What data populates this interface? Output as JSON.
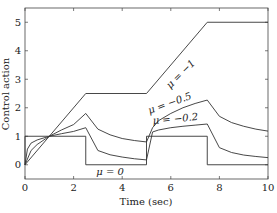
{
  "chart_data": {
    "type": "line",
    "title": "",
    "xlabel": "Time (sec)",
    "ylabel": "Control action",
    "xlim": [
      0,
      10
    ],
    "ylim": [
      -0.5,
      5.5
    ],
    "xticks": [
      0,
      2,
      4,
      6,
      8,
      10
    ],
    "yticks": [
      0,
      1,
      2,
      3,
      4,
      5
    ],
    "grid": false,
    "legend": "none (inline annotations)",
    "series": [
      {
        "name": "μ = −1",
        "label": "μ = −1",
        "x": [
          0,
          2.5,
          5,
          7.5,
          10
        ],
        "y": [
          0,
          2.5,
          2.5,
          5,
          5
        ]
      },
      {
        "name": "μ = −0.5",
        "label": "μ = −0.5",
        "x": [
          0,
          0.25,
          0.5,
          1,
          1.5,
          2,
          2.5,
          2.5,
          3,
          3.5,
          4,
          4.5,
          5,
          5,
          5.25,
          5.5,
          6,
          6.5,
          7,
          7.5,
          7.5,
          8,
          8.5,
          9,
          9.5,
          10
        ],
        "y": [
          0,
          0.5,
          0.71,
          1.0,
          1.22,
          1.41,
          1.8,
          1.8,
          1.25,
          1.05,
          0.92,
          0.85,
          0.8,
          0.8,
          1.3,
          1.55,
          1.8,
          2.0,
          2.15,
          2.27,
          2.27,
          1.7,
          1.48,
          1.35,
          1.25,
          1.18
        ]
      },
      {
        "name": "μ = −0.2",
        "label": "μ = −0.2",
        "x": [
          0,
          0.1,
          0.25,
          0.5,
          1,
          1.5,
          2,
          2.5,
          2.5,
          3,
          3.5,
          4,
          4.5,
          5,
          5,
          5.25,
          5.5,
          6,
          6.5,
          7,
          7.5,
          7.5,
          8,
          8.5,
          9,
          9.5,
          10
        ],
        "y": [
          0,
          0.55,
          0.76,
          0.87,
          1.0,
          1.09,
          1.17,
          1.3,
          1.3,
          0.5,
          0.35,
          0.27,
          0.21,
          0.17,
          0.17,
          1.15,
          1.22,
          1.3,
          1.35,
          1.39,
          1.43,
          1.43,
          0.6,
          0.43,
          0.34,
          0.29,
          0.25
        ]
      },
      {
        "name": "μ = 0",
        "label": "μ = 0",
        "x": [
          0,
          0,
          2.5,
          2.5,
          5,
          5,
          7.5,
          7.5,
          10
        ],
        "y": [
          0,
          1,
          1,
          0,
          0,
          1,
          1,
          0,
          0
        ]
      }
    ],
    "annotations": [
      {
        "text": "μ = −1",
        "x": 6.5,
        "y": 3.1,
        "rotation": -45
      },
      {
        "text": "μ = −0.5",
        "x": 6.0,
        "y": 2.05,
        "rotation": -20
      },
      {
        "text": "μ = −0.2",
        "x": 6.2,
        "y": 1.5,
        "rotation": -5
      },
      {
        "text": "μ = 0",
        "x": 3.5,
        "y": -0.35,
        "rotation": 0
      }
    ]
  }
}
